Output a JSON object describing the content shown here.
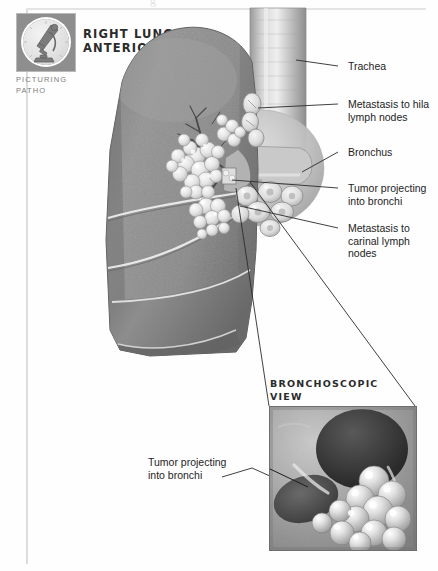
{
  "page": {
    "ghost_header": "g"
  },
  "logo": {
    "icon": "microscope-icon",
    "caption_line1": "PICTURING",
    "caption_line2": "PATHO"
  },
  "headings": {
    "main_line1": "RIGHT LUNG—",
    "main_line2": "ANTERIOR VIEW",
    "bronchoscopic_line1": "BRONCHOSCOPIC",
    "bronchoscopic_line2": "VIEW"
  },
  "labels": {
    "trachea": "Trachea",
    "metastasis_hila": "Metastasis to hila\nlymph nodes",
    "metastasis_hila_l1": "Metastasis to hila",
    "metastasis_hila_l2": "lymph nodes",
    "bronchus": "Bronchus",
    "tumor_bronchi_l1": "Tumor projecting",
    "tumor_bronchi_l2": "into bronchi",
    "metastasis_carinal_l1": "Metastasis to",
    "metastasis_carinal_l2": "carinal lymph",
    "metastasis_carinal_l3": "nodes",
    "tumor_bronchi_lower_l1": "Tumor projecting",
    "tumor_bronchi_lower_l2": "into bronchi"
  },
  "colors": {
    "lung_tissue": "#8d8d8d",
    "lung_tissue_dark": "#6f6f6f",
    "tumor": "#e8e8e8",
    "airway": "#b5b5b5",
    "leader_line": "#2b2b2b",
    "logo_box": "#8e8e8e",
    "bronchoscopy_bg": "#9a9a9a",
    "bronchoscopy_lumen": "#3a3a3a",
    "text": "#1d1d1d"
  },
  "anatomy": {
    "structures": [
      "right lung (three lobes)",
      "horizontal fissure",
      "oblique fissure",
      "trachea",
      "right main bronchus",
      "hilar lymph nodes",
      "carinal lymph nodes",
      "bronchogenic tumor mass"
    ],
    "view": "anterior",
    "side": "right"
  }
}
